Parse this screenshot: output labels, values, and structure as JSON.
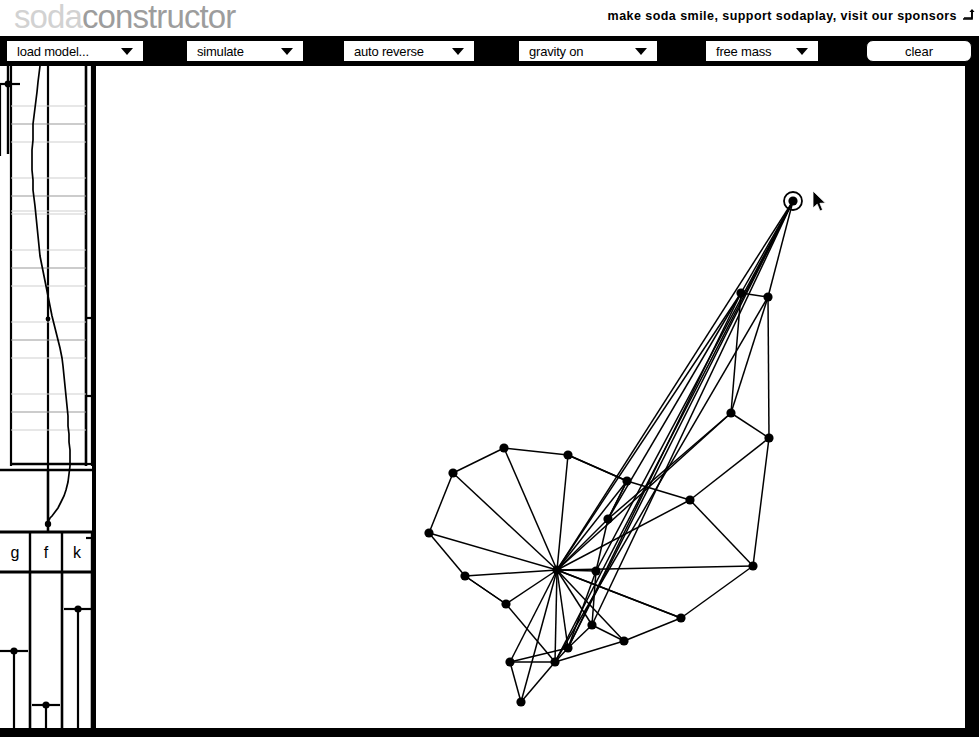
{
  "app": {
    "logo_soda": "soda",
    "logo_constructor": "constructor",
    "tagline": "make soda smile, support sodaplay, visit our sponsors",
    "tagline_icon": "external-link-arrow-icon"
  },
  "toolbar": {
    "background_color": "#000000",
    "controls": [
      {
        "name": "load-model",
        "label": "load model...",
        "type": "select",
        "icon": "chevron-down-icon"
      },
      {
        "name": "simulate",
        "label": "simulate",
        "type": "select",
        "icon": "chevron-down-icon"
      },
      {
        "name": "auto-reverse",
        "label": "auto reverse",
        "type": "select",
        "icon": "chevron-down-icon"
      },
      {
        "name": "gravity",
        "label": "gravity on",
        "type": "select",
        "icon": "chevron-down-icon"
      },
      {
        "name": "mass-mode",
        "label": "free mass",
        "type": "select",
        "icon": "chevron-down-icon"
      },
      {
        "name": "clear",
        "label": "clear",
        "type": "button",
        "icon": ""
      }
    ]
  },
  "sidebar": {
    "amplitude_slider": {
      "name": "amplitude-slider",
      "handle_y": 80,
      "track_x": 8
    },
    "wave_panel": {
      "name": "wave-editor",
      "gridline_count": 11,
      "curve_label": "muscle-wave-curve"
    },
    "sliders": [
      {
        "key": "g",
        "label": "g",
        "name": "gravity-slider",
        "handle_y": 651,
        "track_x": 44
      },
      {
        "key": "f",
        "label": "f",
        "name": "friction-slider",
        "handle_y": 705,
        "track_x": 144
      },
      {
        "key": "k",
        "label": "k",
        "name": "springiness-slider",
        "handle_y": 609,
        "track_x": 245
      }
    ]
  },
  "canvas": {
    "name": "model-canvas",
    "background_color": "#ffffff",
    "node_color": "#000000",
    "spring_color": "#000000",
    "selected_node_index": 0,
    "cursor": {
      "x": 812,
      "y": 190,
      "icon": "arrow-pointer-icon"
    },
    "nodes": [
      [
        793,
        201
      ],
      [
        741,
        293
      ],
      [
        768,
        297
      ],
      [
        731,
        413
      ],
      [
        769,
        438
      ],
      [
        627,
        481
      ],
      [
        690,
        500
      ],
      [
        753,
        566
      ],
      [
        504,
        448
      ],
      [
        568,
        455
      ],
      [
        453,
        473
      ],
      [
        429,
        533
      ],
      [
        465,
        576
      ],
      [
        557,
        570
      ],
      [
        608,
        519
      ],
      [
        596,
        571
      ],
      [
        506,
        604
      ],
      [
        681,
        618
      ],
      [
        592,
        625
      ],
      [
        624,
        641
      ],
      [
        568,
        648
      ],
      [
        510,
        662
      ],
      [
        555,
        662
      ],
      [
        521,
        702
      ]
    ],
    "springs": [
      [
        0,
        1
      ],
      [
        0,
        2
      ],
      [
        0,
        13
      ],
      [
        0,
        15
      ],
      [
        0,
        18
      ],
      [
        1,
        2
      ],
      [
        1,
        3
      ],
      [
        1,
        14
      ],
      [
        1,
        13
      ],
      [
        2,
        4
      ],
      [
        2,
        3
      ],
      [
        3,
        4
      ],
      [
        3,
        13
      ],
      [
        3,
        14
      ],
      [
        4,
        7
      ],
      [
        4,
        6
      ],
      [
        5,
        6
      ],
      [
        5,
        9
      ],
      [
        5,
        14
      ],
      [
        5,
        13
      ],
      [
        6,
        7
      ],
      [
        6,
        13
      ],
      [
        7,
        17
      ],
      [
        7,
        13
      ],
      [
        8,
        9
      ],
      [
        8,
        10
      ],
      [
        8,
        13
      ],
      [
        9,
        5
      ],
      [
        9,
        13
      ],
      [
        10,
        11
      ],
      [
        10,
        13
      ],
      [
        11,
        12
      ],
      [
        11,
        13
      ],
      [
        12,
        13
      ],
      [
        12,
        16
      ],
      [
        13,
        14
      ],
      [
        13,
        15
      ],
      [
        13,
        16
      ],
      [
        13,
        17
      ],
      [
        13,
        18
      ],
      [
        13,
        19
      ],
      [
        13,
        20
      ],
      [
        13,
        21
      ],
      [
        13,
        22
      ],
      [
        13,
        23
      ],
      [
        14,
        15
      ],
      [
        14,
        5
      ],
      [
        15,
        18
      ],
      [
        15,
        20
      ],
      [
        16,
        12
      ],
      [
        16,
        22
      ],
      [
        17,
        19
      ],
      [
        17,
        13
      ],
      [
        18,
        19
      ],
      [
        18,
        20
      ],
      [
        20,
        22
      ],
      [
        20,
        21
      ],
      [
        21,
        22
      ],
      [
        21,
        23
      ],
      [
        22,
        23
      ],
      [
        19,
        22
      ],
      [
        1,
        20
      ],
      [
        2,
        22
      ],
      [
        0,
        22
      ],
      [
        0,
        20
      ]
    ]
  }
}
